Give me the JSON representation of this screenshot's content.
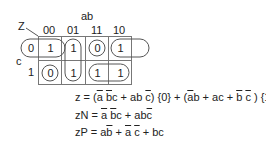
{
  "kmap": {
    "output_label": "Z",
    "col_var_label": "ab",
    "row_var_label": "c",
    "col_labels": [
      "00",
      "01",
      "11",
      "10"
    ],
    "row_labels": [
      "0",
      "1"
    ],
    "cells": [
      [
        "1",
        "1",
        "0",
        "1"
      ],
      [
        "0",
        "1",
        "1",
        "1"
      ]
    ],
    "groupings": [
      {
        "type": "wrap-pair",
        "cells": [
          [
            0,
            0
          ],
          [
            0,
            3
          ]
        ],
        "note": "c=0, ab=00 and ab=10"
      },
      {
        "type": "vertical-pair",
        "cells": [
          [
            0,
            1
          ],
          [
            1,
            1
          ]
        ]
      },
      {
        "type": "single",
        "cells": [
          [
            0,
            2
          ]
        ]
      },
      {
        "type": "single",
        "cells": [
          [
            1,
            0
          ]
        ]
      },
      {
        "type": "horizontal-pair",
        "cells": [
          [
            1,
            2
          ],
          [
            1,
            3
          ]
        ]
      },
      {
        "type": "row0-zero-label",
        "note": "row 0 label circled with wrap loop"
      }
    ]
  },
  "equations": {
    "z": {
      "lhs": "z = ",
      "terms": [
        {
          "text": "(",
          "over": false
        },
        {
          "text": "a",
          "over": true
        },
        {
          "text": " ",
          "over": false
        },
        {
          "text": "b",
          "over": true
        },
        {
          "text": "c + ab ",
          "over": false
        },
        {
          "text": "c",
          "over": true
        },
        {
          "text": ") {0} + (",
          "over": false
        },
        {
          "text": "a",
          "over": true
        },
        {
          "text": "b + ac + ",
          "over": false
        },
        {
          "text": "b",
          "over": true
        },
        {
          "text": " ",
          "over": false
        },
        {
          "text": "c",
          "over": true
        },
        {
          "text": " ) {1}",
          "over": false
        }
      ]
    },
    "zN": {
      "lhs": "zN = ",
      "terms": [
        {
          "text": "a",
          "over": true
        },
        {
          "text": " ",
          "over": false
        },
        {
          "text": "b",
          "over": true
        },
        {
          "text": "c + ab",
          "over": false
        },
        {
          "text": "c",
          "over": true
        }
      ]
    },
    "zP": {
      "lhs": "zP = ",
      "terms": [
        {
          "text": "a",
          "over": false
        },
        {
          "text": "b",
          "over": true
        },
        {
          "text": " + ",
          "over": false
        },
        {
          "text": "a",
          "over": true
        },
        {
          "text": " ",
          "over": false
        },
        {
          "text": "c",
          "over": true
        },
        {
          "text": " + bc",
          "over": false
        }
      ]
    }
  },
  "colors": {
    "text": "#222222",
    "lines": "#555555",
    "background": "#ffffff"
  }
}
